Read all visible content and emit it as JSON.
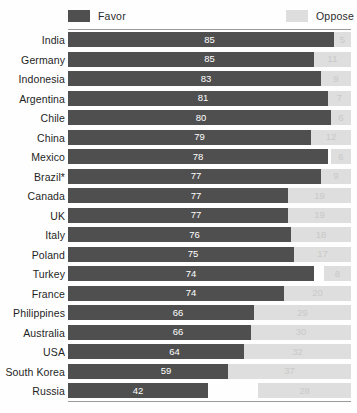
{
  "legend": {
    "favor_label": "Favor",
    "oppose_label": "Oppose",
    "favor_color": "#4f4f4f",
    "oppose_color": "#dedede"
  },
  "chart_data": {
    "type": "bar",
    "orientation": "horizontal",
    "title": "",
    "subtitle": "",
    "xlabel": "",
    "ylabel": "",
    "xlim": [
      0,
      100
    ],
    "grid": false,
    "legend_position": "top",
    "note": "Brazil*",
    "categories": [
      "India",
      "Germany",
      "Indonesia",
      "Argentina",
      "Chile",
      "China",
      "Mexico",
      "Brazil*",
      "Canada",
      "UK",
      "Italy",
      "Poland",
      "Turkey",
      "France",
      "Philippines",
      "Australia",
      "USA",
      "South Korea",
      "Russia"
    ],
    "series": [
      {
        "name": "Favor",
        "color": "#4f4f4f",
        "values": [
          85,
          85,
          83,
          81,
          80,
          79,
          78,
          77,
          77,
          77,
          76,
          75,
          74,
          74,
          66,
          66,
          64,
          59,
          42
        ]
      },
      {
        "name": "Oppose",
        "color": "#dedede",
        "values": [
          5,
          11,
          9,
          7,
          6,
          12,
          6,
          9,
          19,
          19,
          18,
          17,
          8,
          20,
          29,
          30,
          32,
          37,
          28
        ]
      }
    ]
  }
}
